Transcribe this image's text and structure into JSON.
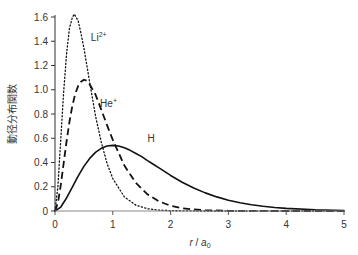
{
  "chart_data": {
    "type": "line",
    "title": "",
    "xlabel": "r / a0",
    "ylabel": "動径分布関数",
    "xlim": [
      0,
      5
    ],
    "ylim": [
      0,
      1.6
    ],
    "x_ticks": [
      0,
      1,
      2,
      3,
      4,
      5
    ],
    "y_ticks": [
      0,
      0.2,
      0.4,
      0.6,
      0.8,
      1.0,
      1.2,
      1.4,
      1.6
    ],
    "y_tick_labels": [
      "0",
      "0.2",
      "0.4",
      "0.6",
      "0.8",
      "1.0",
      "1.2",
      "1.4",
      "1.6"
    ],
    "grid": false,
    "legend": "inline labels",
    "series": [
      {
        "name": "H",
        "label_main": "H",
        "label_sup": "",
        "style": "solid",
        "color": "#111111",
        "label_pos": [
          1.6,
          0.57
        ],
        "x": [
          0,
          0.1,
          0.2,
          0.3,
          0.4,
          0.5,
          0.6,
          0.7,
          0.8,
          0.9,
          1.0,
          1.1,
          1.2,
          1.3,
          1.4,
          1.5,
          1.6,
          1.7,
          1.8,
          1.9,
          2.0,
          2.2,
          2.4,
          2.6,
          2.8,
          3.0,
          3.2,
          3.4,
          3.6,
          3.8,
          4.0,
          4.5,
          5.0
        ],
        "y": [
          0,
          0.0327,
          0.1073,
          0.1976,
          0.2876,
          0.3679,
          0.4337,
          0.4834,
          0.5168,
          0.5355,
          0.5413,
          0.536,
          0.5216,
          0.5003,
          0.474,
          0.4481,
          0.416,
          0.3855,
          0.3551,
          0.3253,
          0.2931,
          0.2373,
          0.1899,
          0.1495,
          0.1164,
          0.0892,
          0.068,
          0.0515,
          0.0387,
          0.0289,
          0.0215,
          0.01,
          0.0045
        ]
      },
      {
        "name": "He+",
        "label_main": "He",
        "label_sup": "+",
        "style": "dashed",
        "color": "#111111",
        "label_pos": [
          0.78,
          0.86
        ],
        "x": [
          0,
          0.05,
          0.1,
          0.15,
          0.2,
          0.25,
          0.3,
          0.35,
          0.4,
          0.45,
          0.5,
          0.55,
          0.6,
          0.7,
          0.8,
          0.9,
          1.0,
          1.2,
          1.4,
          1.6,
          1.8,
          2.0,
          2.2,
          2.4,
          2.6,
          3.0,
          3.5,
          4.0,
          5.0
        ],
        "y": [
          0,
          0.0655,
          0.2145,
          0.3951,
          0.5752,
          0.7358,
          0.8674,
          0.9666,
          1.0295,
          1.0659,
          1.0827,
          1.074,
          1.0431,
          0.9607,
          0.8365,
          0.7083,
          0.5861,
          0.3745,
          0.2311,
          0.1372,
          0.0793,
          0.0429,
          0.0232,
          0.0124,
          0.0066,
          0.0018,
          0.0003,
          0,
          0
        ]
      },
      {
        "name": "Li2+",
        "label_main": "Li",
        "label_sup": "2+",
        "style": "dotted",
        "color": "#111111",
        "label_pos": [
          0.62,
          1.4
        ],
        "x": [
          0,
          0.05,
          0.1,
          0.15,
          0.2,
          0.25,
          0.3,
          0.333,
          0.35,
          0.4,
          0.45,
          0.5,
          0.6,
          0.7,
          0.8,
          0.9,
          1.0,
          1.2,
          1.4,
          1.6,
          1.8,
          2.0,
          2.5,
          3.0,
          5.0
        ],
        "y": [
          0,
          0.2,
          0.5927,
          0.9841,
          1.2954,
          1.5068,
          1.5947,
          1.624,
          1.61,
          1.5698,
          1.4645,
          1.3443,
          1.0626,
          0.7862,
          0.5692,
          0.3932,
          0.2677,
          0.1163,
          0.0478,
          0.0188,
          0.0071,
          0.0027,
          0.0002,
          0,
          0
        ]
      }
    ]
  },
  "axes": {
    "xlabel_main": "r",
    "xlabel_sep": " / ",
    "xlabel_unit": "a",
    "xlabel_sub": "0",
    "ylabel": "動径分布関数"
  }
}
